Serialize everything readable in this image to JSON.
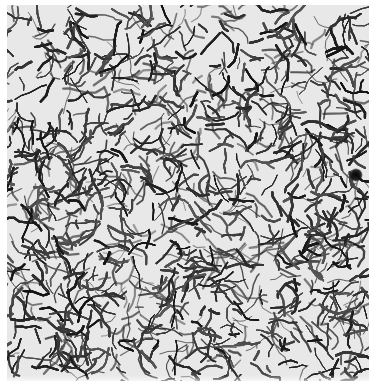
{
  "image": {
    "description": "Grayscale photomicrograph-like texture of a dense, tangled network of dark branching fibers/cracks on a light background",
    "width": 376,
    "height": 388,
    "texture_region": {
      "x": 7,
      "y": 5,
      "width": 362,
      "height": 376
    },
    "background_color": "#ffffff",
    "paper_color": "#e8e8e8",
    "ink_color": "#1e1e1e",
    "features": [
      {
        "name": "dark-blob",
        "x": 356,
        "y": 175,
        "radius": 7
      },
      {
        "name": "light-patch-top",
        "x": 205,
        "y": 40,
        "radius": 14
      },
      {
        "name": "light-patch-lower",
        "x": 135,
        "y": 268,
        "radius": 8
      }
    ]
  },
  "caption": "Fibrous network texture"
}
